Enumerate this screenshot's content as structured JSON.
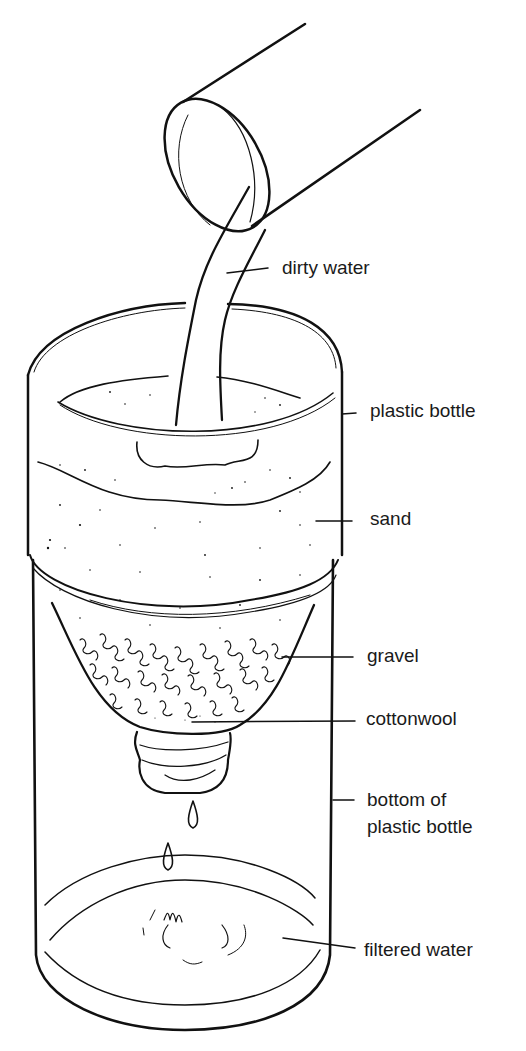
{
  "diagram": {
    "colors": {
      "ink": "#111111",
      "background": "#ffffff"
    },
    "labels": [
      {
        "id": "dirty-water",
        "text": "dirty water"
      },
      {
        "id": "plastic-bottle",
        "text": "plastic bottle"
      },
      {
        "id": "sand",
        "text": "sand"
      },
      {
        "id": "gravel",
        "text": "gravel"
      },
      {
        "id": "cottonwool",
        "text": "cottonwool"
      },
      {
        "id": "bottom-of-plastic-bottle",
        "line1": "bottom of",
        "line2": "plastic bottle"
      },
      {
        "id": "filtered-water",
        "text": "filtered water"
      }
    ],
    "parts": [
      "pipe",
      "water-stream",
      "upper-bottle-top",
      "sand-layer",
      "gravel-layer",
      "cottonwool-layer",
      "bottle-neck",
      "water-drops",
      "lower-bottle",
      "filtered-water-pool"
    ]
  }
}
